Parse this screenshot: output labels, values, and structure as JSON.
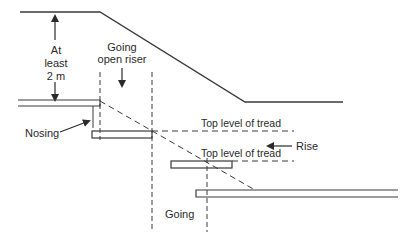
{
  "diagram": {
    "colors": {
      "line": "#3a3a3a",
      "text": "#2a2a2a",
      "background": "#ffffff"
    },
    "labels": {
      "headroom_line1": "At",
      "headroom_line2": "least",
      "headroom_line3": "2 m",
      "going_open_riser_line1": "Going",
      "going_open_riser_line2": "open riser",
      "nosing": "Nosing",
      "top_level_1": "Top level of tread",
      "top_level_2": "Top level of tread",
      "rise": "Rise",
      "going": "Going"
    }
  }
}
